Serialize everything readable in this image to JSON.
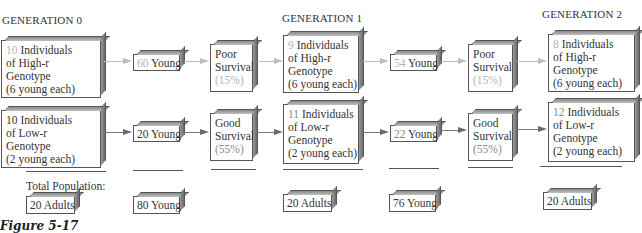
{
  "generations": [
    {
      "label": "GENERATION 0",
      "high_r": {
        "count": "10",
        "line1": " Individuals",
        "line2": "of High-r",
        "line3": "Genotype",
        "line4": "(6 young each)"
      },
      "low_r": {
        "count": "10",
        "line1": " Individuals",
        "line2": "of Low-r",
        "line3": "Genotype",
        "line4": "(2 young each)"
      },
      "total": "20 Adults"
    },
    {
      "label": "GENERATION 1",
      "high_r": {
        "count": "9",
        "line1": " Individuals",
        "line2": "of High-r",
        "line3": "Genotype",
        "line4": "(6 young each)"
      },
      "low_r": {
        "count": "11",
        "line1": " Individuals",
        "line2": "of Low-r",
        "line3": "Genotype",
        "line4": "(2 young each)"
      },
      "total": "20 Adults"
    },
    {
      "label": "GENERATION 2",
      "high_r": {
        "count": "8",
        "line1": " Individuals",
        "line2": "of High-r",
        "line3": "Genotype",
        "line4": "(6 young each)"
      },
      "low_r": {
        "count": "12",
        "line1": " Individuals",
        "line2": "of Low-r",
        "line3": "Genotype",
        "line4": "(2 young each)"
      },
      "total": "20 Adults"
    }
  ],
  "young": [
    {
      "high_count": "60",
      "low_count": "20",
      "word": " Young",
      "total": "80 Young"
    },
    {
      "high_count": "54",
      "low_count": "22",
      "word": " Young",
      "total": "76 Young"
    }
  ],
  "survival": [
    {
      "high": {
        "line1": "Poor",
        "line2": "Survival",
        "pct": "(15%)"
      },
      "low": {
        "line1": "Good",
        "line2": "Survival",
        "pct": "(55%)"
      }
    },
    {
      "high": {
        "line1": "Poor",
        "line2": "Survival",
        "pct": "(15%)"
      },
      "low": {
        "line1": "Good",
        "line2": "Survival",
        "pct": "(55%)"
      }
    }
  ],
  "total_population_label": "Total Population:",
  "caption": "Figure 5-17",
  "colors": {
    "faded_number": "#b5b5b5",
    "light_arrow": "#bdbdbd",
    "dark_arrow": "#6a6a6a",
    "border": "#555555"
  }
}
